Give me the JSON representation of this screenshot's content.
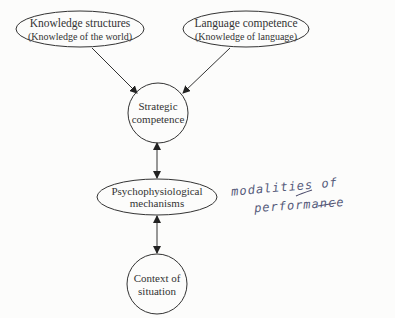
{
  "diagram": {
    "nodes": {
      "knowledge": {
        "line1": "Knowledge structures",
        "line2": "(Knowledge of the world)"
      },
      "language": {
        "line1": "Language competence",
        "line2": "(Knowledge of language)"
      },
      "strategic": {
        "line1": "Strategic",
        "line2": "competence"
      },
      "psycho": {
        "line1": "Psychophysiological",
        "line2": "mechanisms"
      },
      "context": {
        "line1": "Context of",
        "line2": "situation"
      }
    },
    "annotation": {
      "line1": "modalities of",
      "line2": "performance"
    },
    "edges": [
      {
        "from": "knowledge",
        "to": "strategic",
        "type": "arrow"
      },
      {
        "from": "language",
        "to": "strategic",
        "type": "arrow"
      },
      {
        "from": "strategic",
        "to": "psycho",
        "type": "double-arrow"
      },
      {
        "from": "psycho",
        "to": "context",
        "type": "double-arrow"
      }
    ],
    "colors": {
      "stroke": "#333333",
      "background": "#fcfcfb",
      "handwriting": "#555a7a"
    }
  }
}
